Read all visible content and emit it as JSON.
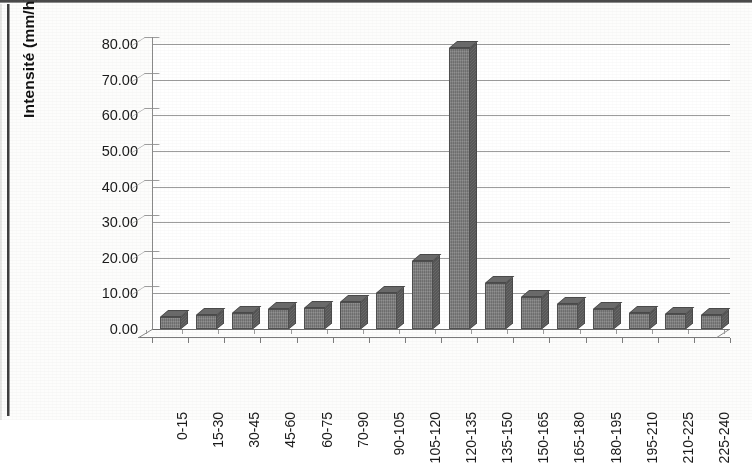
{
  "chart_data": {
    "type": "bar",
    "title": "",
    "xlabel": "",
    "ylabel": "Intensité (mm/h)",
    "ylim": [
      0,
      80
    ],
    "ytick_labels": [
      "80.00",
      "70.00",
      "60.00",
      "50.00",
      "40.00",
      "30.00",
      "20.00",
      "10.00",
      "0.00"
    ],
    "ytick_values": [
      80,
      70,
      60,
      50,
      40,
      30,
      20,
      10,
      0
    ],
    "grid": true,
    "legend": "none",
    "style": "3d-column",
    "categories": [
      "0-15",
      "15-30",
      "30-45",
      "45-60",
      "60-75",
      "70-90",
      "90-105",
      "105-120",
      "120-135",
      "135-150",
      "150-165",
      "165-180",
      "180-195",
      "195-210",
      "210-225",
      "225-240"
    ],
    "values": [
      3.5,
      4.0,
      4.5,
      5.5,
      6.0,
      7.5,
      10.0,
      19.0,
      79.0,
      13.0,
      9.0,
      7.0,
      5.5,
      4.5,
      4.2,
      4.0
    ],
    "series": [
      {
        "name": "Intensité",
        "values": [
          3.5,
          4.0,
          4.5,
          5.5,
          6.0,
          7.5,
          10.0,
          19.0,
          79.0,
          13.0,
          9.0,
          7.0,
          5.5,
          4.5,
          4.2,
          4.0
        ]
      }
    ],
    "peak_category": "120-135",
    "peak_value": 79.0
  },
  "colors": {
    "bar_front": "#7c7c7c",
    "bar_side": "#5f5f5f",
    "bar_top": "#6a6a6a",
    "bar_outline": "#4f4f4f",
    "gridline": "#9d9d9d",
    "axis": "#6f6f6f",
    "text": "#1b1b1b",
    "background": "#ffffff"
  }
}
